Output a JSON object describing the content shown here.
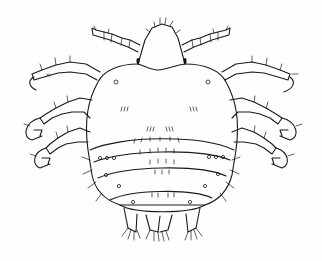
{
  "image": {
    "subject": "line drawing of a crab louse (dorsal view)",
    "style": "black ink line illustration on white background",
    "colors": {
      "background": "#fefefe",
      "ink": "#1a1a1a"
    },
    "parts": [
      "head",
      "antennae",
      "thorax",
      "abdomen",
      "legs",
      "claws",
      "posterior lobes",
      "setae"
    ]
  }
}
